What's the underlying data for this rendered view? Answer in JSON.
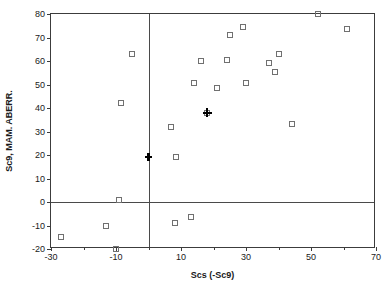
{
  "chart_data": {
    "type": "scatter",
    "title": "",
    "xlabel": "Scs (-Sc9)",
    "ylabel": "Sc9, MAM. ABERR.",
    "xlim": [
      -30,
      70
    ],
    "ylim": [
      -20,
      80
    ],
    "xticks": [
      -30,
      -10,
      10,
      30,
      50,
      70
    ],
    "xtick_labels": [
      "-30",
      "-10",
      "10",
      "30",
      "50",
      "70"
    ],
    "xticks_minor": [
      -20,
      0,
      20,
      40,
      60
    ],
    "yticks": [
      -20,
      -10,
      0,
      10,
      20,
      30,
      40,
      50,
      60,
      70,
      80
    ],
    "ytick_labels": [
      "-20",
      "-10",
      "0",
      "10",
      "20",
      "30",
      "40",
      "50",
      "60",
      "70",
      "80"
    ],
    "grid": false,
    "legend": null,
    "reference_lines": [
      {
        "axis": "x",
        "value": 0
      },
      {
        "axis": "y",
        "value": 0
      }
    ],
    "series": [
      {
        "name": "samples",
        "marker": "open-square",
        "color": "#707070",
        "points": [
          {
            "x": -27,
            "y": -15
          },
          {
            "x": -13,
            "y": -10
          },
          {
            "x": -10,
            "y": -20
          },
          {
            "x": -9,
            "y": 1
          },
          {
            "x": -8.5,
            "y": 42
          },
          {
            "x": -5,
            "y": 63
          },
          {
            "x": 7,
            "y": 32
          },
          {
            "x": 8,
            "y": -9
          },
          {
            "x": 8.5,
            "y": 19
          },
          {
            "x": 13,
            "y": -6.5
          },
          {
            "x": 14,
            "y": 50.5
          },
          {
            "x": 16,
            "y": 60
          },
          {
            "x": 18,
            "y": 38
          },
          {
            "x": 21,
            "y": 48.5
          },
          {
            "x": 24,
            "y": 60.5
          },
          {
            "x": 25,
            "y": 71
          },
          {
            "x": 29,
            "y": 74.5
          },
          {
            "x": 30,
            "y": 50.5
          },
          {
            "x": 37,
            "y": 59
          },
          {
            "x": 39,
            "y": 55.5
          },
          {
            "x": 40,
            "y": 63
          },
          {
            "x": 44,
            "y": 33
          },
          {
            "x": 52,
            "y": 80
          },
          {
            "x": 61,
            "y": 73.5
          }
        ]
      },
      {
        "name": "highlight-plus",
        "marker": "plus",
        "color": "#000000",
        "points": [
          {
            "x": 18,
            "y": 38
          }
        ]
      },
      {
        "name": "highlight-cross",
        "marker": "cross",
        "color": "#000000",
        "points": [
          {
            "x": 0,
            "y": 19
          }
        ]
      }
    ]
  }
}
